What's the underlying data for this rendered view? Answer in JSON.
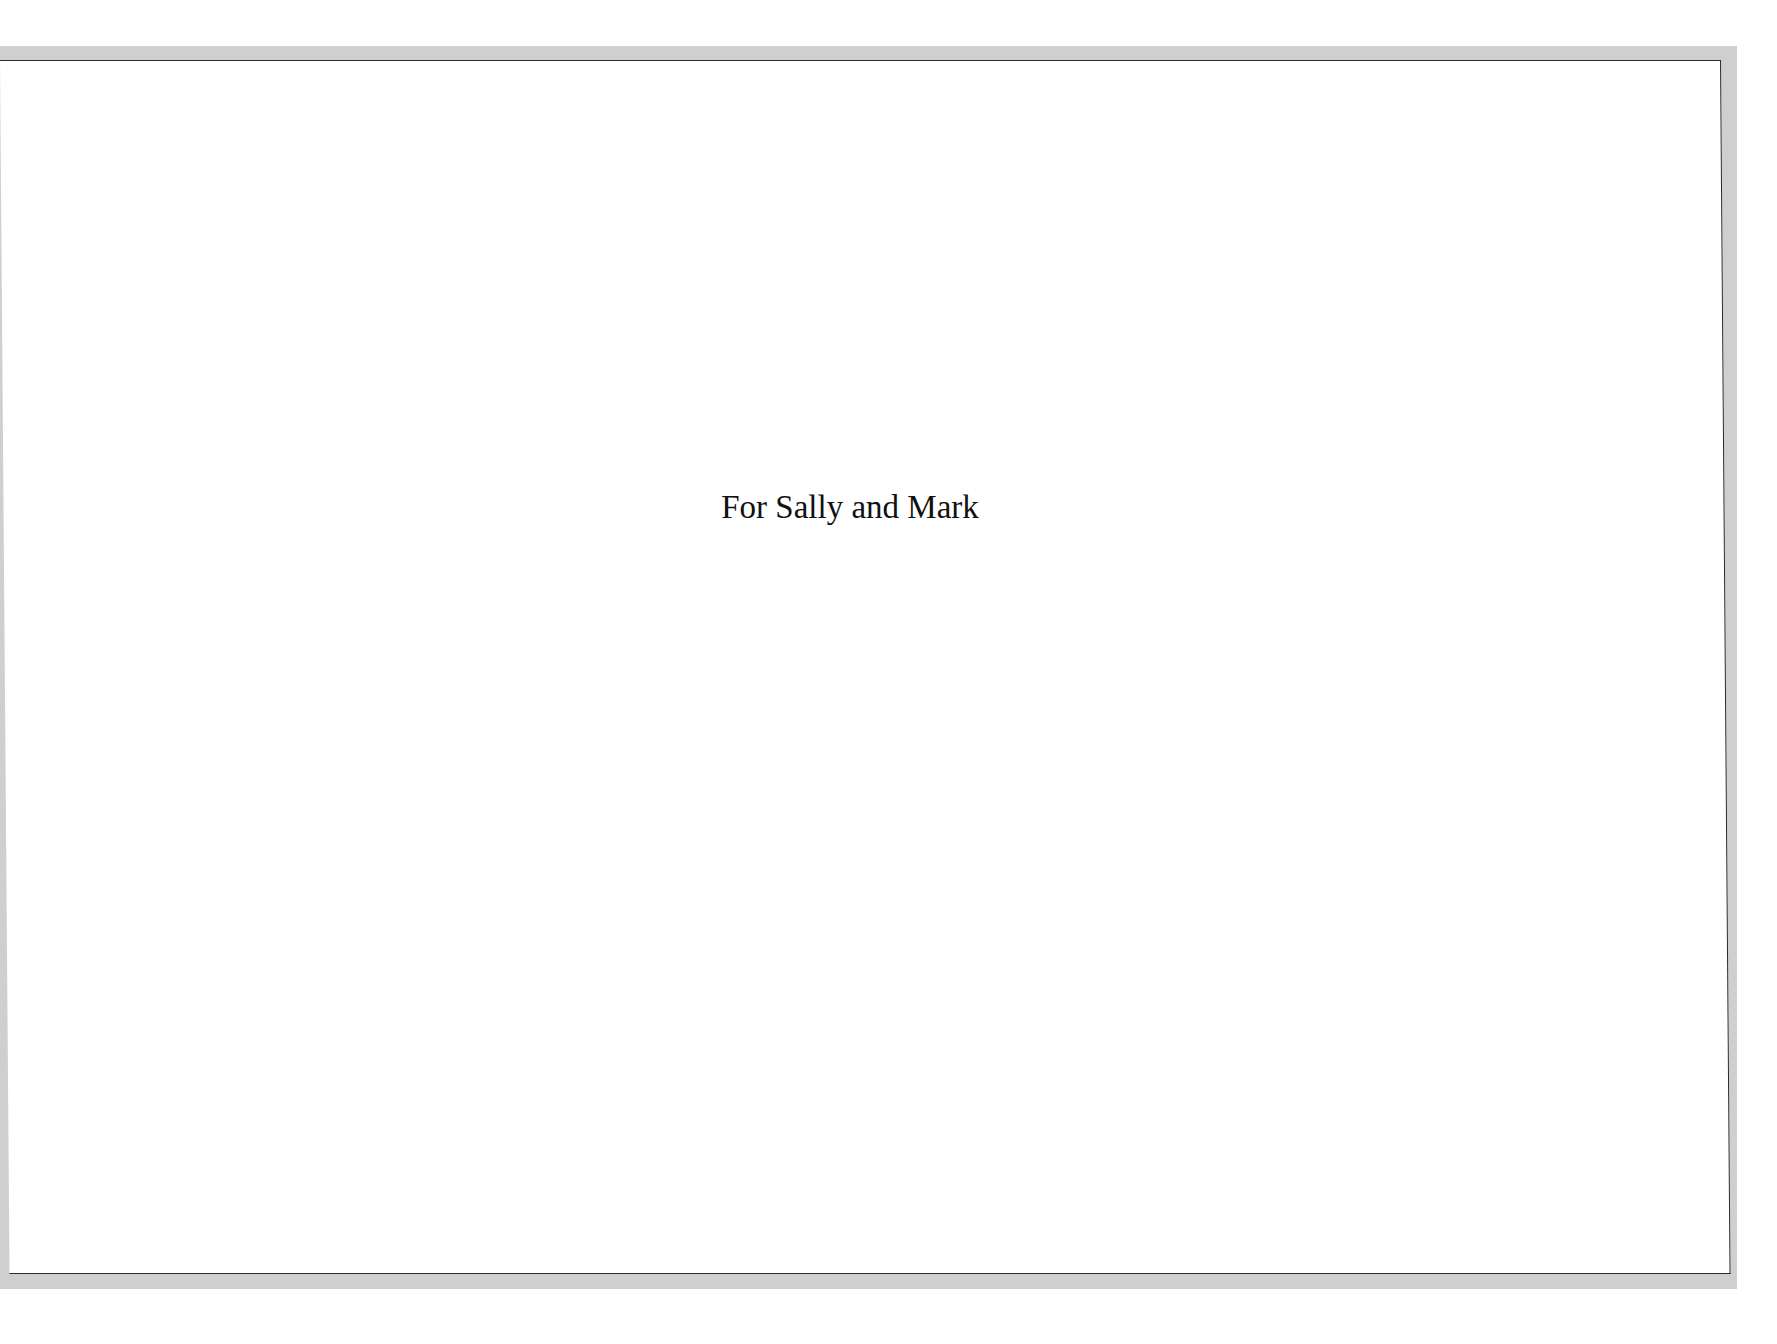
{
  "page": {
    "dedication": "For Sally and Mark"
  },
  "colors": {
    "background": "#ffffff",
    "frame_shadow": "#cfcfcf",
    "frame_line": "#2a2a2a",
    "text": "#111111"
  }
}
